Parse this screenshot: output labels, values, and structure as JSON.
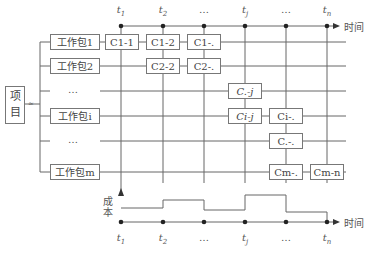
{
  "diagram": {
    "root": {
      "label_line1": "项",
      "label_line2": "目"
    },
    "work_packages": [
      {
        "label": "工作包1"
      },
      {
        "label": "工作包2"
      },
      {
        "label": "…"
      },
      {
        "label": "工作包i"
      },
      {
        "label": "…"
      },
      {
        "label": "工作包m"
      }
    ],
    "time_ticks": [
      {
        "base": "t",
        "sub": "1"
      },
      {
        "base": "t",
        "sub": "2"
      },
      {
        "base": "…",
        "sub": ""
      },
      {
        "base": "t",
        "sub": "j"
      },
      {
        "base": "…",
        "sub": ""
      },
      {
        "base": "t",
        "sub": "n"
      }
    ],
    "time_axis_label": "时间",
    "cost_axis_label_line1": "成",
    "cost_axis_label_line2": "本",
    "cost_boxes": [
      {
        "label": "C1-1"
      },
      {
        "label": "C1-2"
      },
      {
        "label": "C1-."
      },
      {
        "label": "C2-2"
      },
      {
        "label": "C2-."
      },
      {
        "label": "C.-j"
      },
      {
        "label": "Ci-j"
      },
      {
        "label": "Ci-."
      },
      {
        "label": "C.-."
      },
      {
        "label": "Cm-."
      },
      {
        "label": "Cm-n"
      }
    ],
    "cost_steps": [
      {
        "from": "t1",
        "to": "t2",
        "level": "low"
      },
      {
        "from": "t2",
        "to": "…",
        "level": "medium"
      },
      {
        "from": "…",
        "to": "tj",
        "level": "lowest"
      },
      {
        "from": "tj",
        "to": "…",
        "level": "high"
      },
      {
        "from": "…",
        "to": "tn",
        "level": "low-medium"
      }
    ]
  }
}
